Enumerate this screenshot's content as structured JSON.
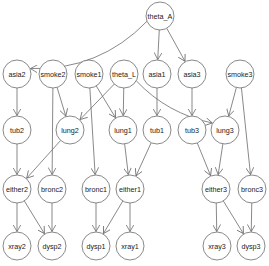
{
  "diagram": {
    "type": "directed-acyclic-graph",
    "node_radius": 14,
    "colors": {
      "stroke": "#6b6b6b",
      "fill": "#ffffff",
      "text": "#222222",
      "background": "#ffffff"
    },
    "nodes": [
      {
        "id": "theta_A",
        "label": "theta_A",
        "x": 160,
        "y": 16
      },
      {
        "id": "asia2",
        "label": "asia2",
        "x": 17,
        "y": 74
      },
      {
        "id": "smoke2",
        "label": "smoke2",
        "x": 53,
        "y": 74
      },
      {
        "id": "smoke1",
        "label": "smoke1",
        "x": 89,
        "y": 74
      },
      {
        "id": "theta_L",
        "label": "theta_L",
        "x": 124,
        "y": 74
      },
      {
        "id": "asia1",
        "label": "asia1",
        "x": 157,
        "y": 74
      },
      {
        "id": "asia3",
        "label": "asia3",
        "x": 192,
        "y": 74
      },
      {
        "id": "smoke3",
        "label": "smoke3",
        "x": 240,
        "y": 74
      },
      {
        "id": "tub2",
        "label": "tub2",
        "x": 17,
        "y": 130
      },
      {
        "id": "lung2",
        "label": "lung2",
        "x": 70,
        "y": 130
      },
      {
        "id": "lung1",
        "label": "lung1",
        "x": 123,
        "y": 130
      },
      {
        "id": "tub1",
        "label": "tub1",
        "x": 157,
        "y": 130
      },
      {
        "id": "tub3",
        "label": "tub3",
        "x": 192,
        "y": 130
      },
      {
        "id": "lung3",
        "label": "lung3",
        "x": 225,
        "y": 130
      },
      {
        "id": "either2",
        "label": "either2",
        "x": 17,
        "y": 189
      },
      {
        "id": "bronc2",
        "label": "bronc2",
        "x": 52,
        "y": 189
      },
      {
        "id": "bronc1",
        "label": "bronc1",
        "x": 96,
        "y": 189
      },
      {
        "id": "either1",
        "label": "either1",
        "x": 130,
        "y": 189
      },
      {
        "id": "either3",
        "label": "either3",
        "x": 216,
        "y": 189
      },
      {
        "id": "bronc3",
        "label": "bronc3",
        "x": 252,
        "y": 189
      },
      {
        "id": "xray2",
        "label": "xray2",
        "x": 17,
        "y": 246
      },
      {
        "id": "dysp2",
        "label": "dysp2",
        "x": 52,
        "y": 246
      },
      {
        "id": "dysp1",
        "label": "dysp1",
        "x": 96,
        "y": 246
      },
      {
        "id": "xray1",
        "label": "xray1",
        "x": 130,
        "y": 246
      },
      {
        "id": "xray3",
        "label": "xray3",
        "x": 217,
        "y": 246
      },
      {
        "id": "dysp3",
        "label": "dysp3",
        "x": 251,
        "y": 246
      }
    ],
    "edges": [
      {
        "from": "theta_A",
        "to": "asia2",
        "curve": -0.18
      },
      {
        "from": "theta_A",
        "to": "asia1"
      },
      {
        "from": "theta_A",
        "to": "asia3"
      },
      {
        "from": "asia2",
        "to": "tub2"
      },
      {
        "from": "smoke2",
        "to": "lung2"
      },
      {
        "from": "smoke2",
        "to": "bronc2"
      },
      {
        "from": "smoke1",
        "to": "lung1"
      },
      {
        "from": "smoke1",
        "to": "bronc1"
      },
      {
        "from": "theta_L",
        "to": "lung2"
      },
      {
        "from": "theta_L",
        "to": "lung1"
      },
      {
        "from": "theta_L",
        "to": "lung3",
        "curve": 0.12
      },
      {
        "from": "asia1",
        "to": "tub1"
      },
      {
        "from": "asia3",
        "to": "tub3"
      },
      {
        "from": "smoke3",
        "to": "lung3"
      },
      {
        "from": "smoke3",
        "to": "bronc3"
      },
      {
        "from": "tub2",
        "to": "either2"
      },
      {
        "from": "lung2",
        "to": "either2"
      },
      {
        "from": "lung1",
        "to": "either1"
      },
      {
        "from": "tub1",
        "to": "either1"
      },
      {
        "from": "tub3",
        "to": "either3"
      },
      {
        "from": "lung3",
        "to": "either3"
      },
      {
        "from": "either2",
        "to": "xray2"
      },
      {
        "from": "either2",
        "to": "dysp2"
      },
      {
        "from": "bronc2",
        "to": "dysp2"
      },
      {
        "from": "bronc1",
        "to": "dysp1"
      },
      {
        "from": "either1",
        "to": "dysp1"
      },
      {
        "from": "either1",
        "to": "xray1"
      },
      {
        "from": "either3",
        "to": "xray3"
      },
      {
        "from": "either3",
        "to": "dysp3"
      },
      {
        "from": "bronc3",
        "to": "dysp3"
      }
    ]
  }
}
